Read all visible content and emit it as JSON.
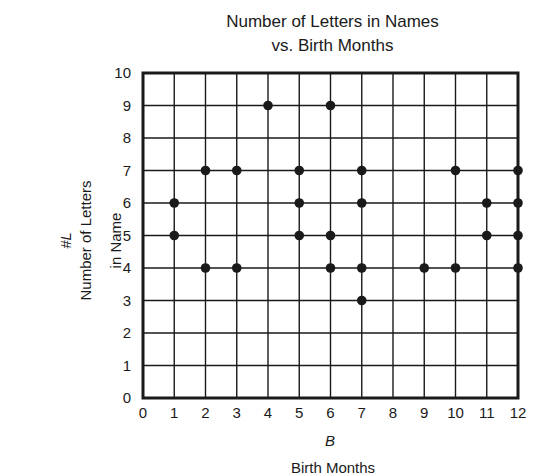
{
  "chart_data": {
    "type": "scatter",
    "title": "Number of Letters in Names vs. Birth Months",
    "title_lines": [
      "Number of Letters in Names",
      "vs. Birth Months"
    ],
    "xlabel": "Birth Months",
    "xlabel_symbol": "B",
    "ylabel": "Number of Letters in Name",
    "ylabel_lines": [
      "Number of Letters",
      "in Name"
    ],
    "ylabel_symbol": "#L",
    "xlim": [
      0,
      12
    ],
    "ylim": [
      0,
      10
    ],
    "xticks": [
      0,
      1,
      2,
      3,
      4,
      5,
      6,
      7,
      8,
      9,
      10,
      11,
      12
    ],
    "yticks": [
      0,
      1,
      2,
      3,
      4,
      5,
      6,
      7,
      8,
      9,
      10
    ],
    "grid": true,
    "legend": null,
    "points": [
      {
        "x": 1,
        "y": 5
      },
      {
        "x": 1,
        "y": 6
      },
      {
        "x": 2,
        "y": 4
      },
      {
        "x": 2,
        "y": 7
      },
      {
        "x": 3,
        "y": 4
      },
      {
        "x": 3,
        "y": 7
      },
      {
        "x": 4,
        "y": 9
      },
      {
        "x": 5,
        "y": 5
      },
      {
        "x": 5,
        "y": 6
      },
      {
        "x": 5,
        "y": 7
      },
      {
        "x": 6,
        "y": 4
      },
      {
        "x": 6,
        "y": 5
      },
      {
        "x": 6,
        "y": 9
      },
      {
        "x": 7,
        "y": 3
      },
      {
        "x": 7,
        "y": 4
      },
      {
        "x": 7,
        "y": 6
      },
      {
        "x": 7,
        "y": 7
      },
      {
        "x": 9,
        "y": 4
      },
      {
        "x": 10,
        "y": 4
      },
      {
        "x": 10,
        "y": 7
      },
      {
        "x": 11,
        "y": 5
      },
      {
        "x": 11,
        "y": 6
      },
      {
        "x": 12,
        "y": 4
      },
      {
        "x": 12,
        "y": 5
      },
      {
        "x": 12,
        "y": 6
      },
      {
        "x": 12,
        "y": 7
      }
    ]
  },
  "colors": {
    "ink": "#1a1a1a",
    "background": "#ffffff"
  }
}
